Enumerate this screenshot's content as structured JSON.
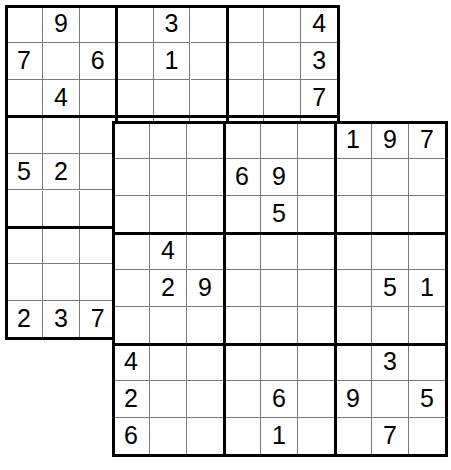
{
  "puzzle": {
    "title": "Overlapping Sudoku (Butterfly / Samurai-style twin grid)",
    "type": "sudoku",
    "grid_size": 9,
    "box_size": 3,
    "grid_count": 2,
    "overlap": {
      "description": "bottom-right 6x6 of grid 1 coincides with top-left 6x6 of grid 2",
      "size": 6
    },
    "colors": {
      "background": "#ffffff",
      "cell_background": "#ffffff",
      "thin_line": "#7a7a7a",
      "thick_line": "#000000",
      "digit": "#000000"
    },
    "grids": [
      {
        "name": "grid-top-left",
        "x": 6,
        "y": 6,
        "cell": 36.9,
        "rows": [
          [
            "",
            "9",
            "",
            "",
            "3",
            "",
            "",
            "",
            "4"
          ],
          [
            "7",
            "",
            "6",
            "",
            "1",
            "",
            "",
            "",
            "3"
          ],
          [
            "",
            "4",
            "",
            "",
            "",
            "",
            "",
            "",
            "7"
          ],
          [
            "",
            "",
            "",
            "",
            "",
            "",
            "",
            "",
            ""
          ],
          [
            "5",
            "2",
            "",
            "",
            "",
            "",
            "6",
            "9",
            ""
          ],
          [
            "",
            "",
            "",
            "",
            "",
            "",
            "",
            "5",
            ""
          ],
          [
            "",
            "",
            "",
            "",
            "4",
            "",
            "",
            "",
            ""
          ],
          [
            "",
            "",
            "",
            "",
            "2",
            "9",
            "",
            "",
            ""
          ],
          [
            "2",
            "3",
            "7",
            "",
            "",
            "",
            "",
            "",
            ""
          ]
        ]
      },
      {
        "name": "grid-bottom-right",
        "x": 113,
        "y": 122,
        "cell": 37.0,
        "rows": [
          [
            "",
            "",
            "",
            "",
            "",
            "",
            "1",
            "9",
            "7"
          ],
          [
            "",
            "",
            "",
            "6",
            "9",
            "",
            "",
            "",
            ""
          ],
          [
            "",
            "",
            "",
            "",
            "5",
            "",
            "",
            "",
            ""
          ],
          [
            "",
            "4",
            "",
            "",
            "",
            "",
            "",
            "",
            ""
          ],
          [
            "",
            "2",
            "9",
            "",
            "",
            "",
            "",
            "5",
            "1"
          ],
          [
            "",
            "",
            "",
            "",
            "",
            "",
            "",
            "",
            ""
          ],
          [
            "4",
            "",
            "",
            "",
            "",
            "",
            "",
            "3",
            ""
          ],
          [
            "2",
            "",
            "",
            "",
            "6",
            "",
            "9",
            "",
            "5"
          ],
          [
            "6",
            "",
            "",
            "",
            "1",
            "",
            "",
            "7",
            ""
          ]
        ]
      }
    ]
  }
}
